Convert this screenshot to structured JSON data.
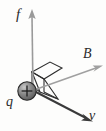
{
  "figure": {
    "background_color": "#fdfdfc",
    "labels": {
      "force": "f",
      "field": "B",
      "velocity": "v",
      "charge": "q",
      "charge_sign": "+"
    },
    "colors": {
      "force_arrow": "#9a9a9a",
      "field_arrow": "#a0a0a0",
      "velocity_arrow": "#3a3a3a",
      "plane_outline": "#2f2f2f",
      "sphere_fill": "#7d7d7d",
      "sphere_outline": "#2a2a2a",
      "label_color": "#2b2b2b"
    },
    "vectors": [
      {
        "name": "force",
        "symbol": "f",
        "direction": "up",
        "origin": [
          33,
          90
        ],
        "tip": [
          32,
          10
        ],
        "style": "light-gray"
      },
      {
        "name": "magnetic-field",
        "symbol": "B",
        "direction": "up-right",
        "origin": [
          33,
          90
        ],
        "tip": [
          100,
          66
        ],
        "style": "light-gray"
      },
      {
        "name": "velocity",
        "symbol": "v",
        "direction": "down-right",
        "origin": [
          33,
          90
        ],
        "tip": [
          92,
          121
        ],
        "style": "dark"
      }
    ],
    "charge": {
      "symbol": "q",
      "sign": "+",
      "center": [
        27,
        91
      ],
      "radius": 9
    },
    "plane": {
      "name": "folded-parallelogram-surface",
      "description": "two joined parallelograms forming a bent plane containing v and B"
    }
  }
}
